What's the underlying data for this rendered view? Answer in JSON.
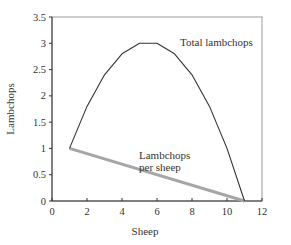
{
  "chart_data": {
    "type": "line",
    "title": "",
    "xlabel": "Sheep",
    "ylabel": "Lambchops",
    "xlim": [
      0,
      12
    ],
    "ylim": [
      0,
      3.5
    ],
    "xticks": [
      0,
      2,
      4,
      6,
      8,
      10,
      12
    ],
    "yticks": [
      0,
      0.5,
      1,
      1.5,
      2,
      2.5,
      3,
      3.5
    ],
    "xtick_labels": [
      "0",
      "2",
      "4",
      "6",
      "8",
      "10",
      "12"
    ],
    "ytick_labels": [
      "0",
      "0.5",
      "1",
      "1.5",
      "2",
      "2.5",
      "3",
      "3.5"
    ],
    "grid": false,
    "legend": "none (inline annotations)",
    "series": [
      {
        "name": "Total lambchops",
        "color": "#333333",
        "x": [
          1,
          2,
          3,
          4,
          5,
          6,
          7,
          8,
          9,
          10,
          11
        ],
        "y": [
          1.0,
          1.8,
          2.4,
          2.8,
          3.0,
          3.0,
          2.8,
          2.4,
          1.8,
          1.0,
          0.0
        ]
      },
      {
        "name": "Lambchops per sheep",
        "color": "#a6a6a6",
        "x": [
          1,
          11
        ],
        "y": [
          1.0,
          0.0
        ]
      }
    ],
    "annotations": [
      {
        "text": "Total lambchops",
        "x": 7.0,
        "y": 2.95
      },
      {
        "text": "Lambchops",
        "x": 5.2,
        "y": 0.85
      },
      {
        "text": "per sheep",
        "x": 5.2,
        "y": 0.7
      }
    ]
  },
  "labels": {
    "xlabel": "Sheep",
    "ylabel": "Lambchops",
    "annot_total": "Total lambchops",
    "annot_per_line1": "Lambchops",
    "annot_per_line2": "per sheep"
  }
}
